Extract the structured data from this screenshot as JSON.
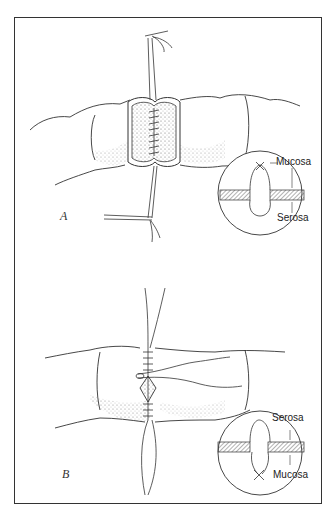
{
  "figure": {
    "panels": [
      {
        "label": "A",
        "description": "Opened bowel segment with stay sutures and continuous inner-layer sutures",
        "inset": {
          "top_label": "Mucosa",
          "bottom_label": "Serosa"
        }
      },
      {
        "label": "B",
        "description": "Closed anastomosis with interrupted outer-layer sutures",
        "inset": {
          "top_label": "Serosa",
          "bottom_label": "Mucosa"
        }
      }
    ],
    "colors": {
      "line": "#333333",
      "stipple": "#555555",
      "hatch": "#666666",
      "background": "#ffffff"
    }
  }
}
